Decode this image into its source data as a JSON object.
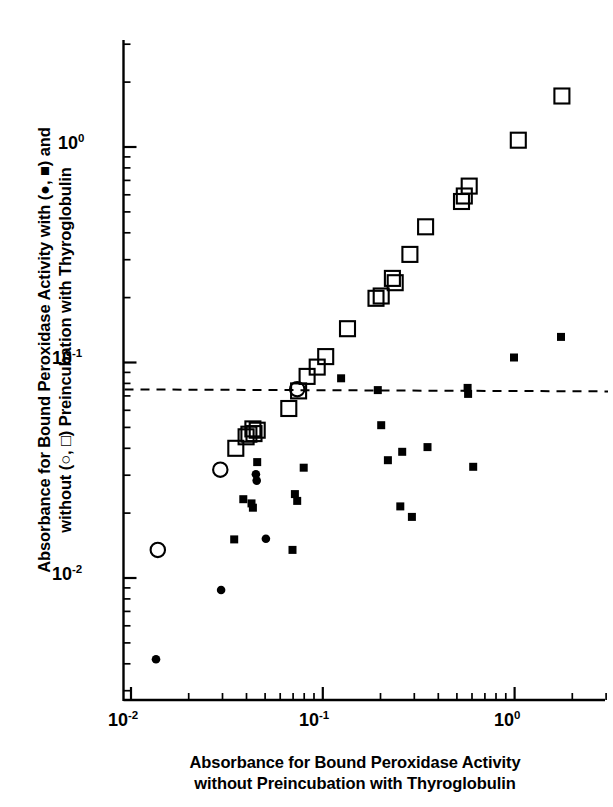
{
  "chart_data": {
    "type": "scatter",
    "title": "",
    "xlabel": "Absorbance for Bound Peroxidase Activity without Preincubation with Thyroglobulin",
    "ylabel": "Absorbance for Bound Peroxidase Activity with (●, ■) and without (○, □) Preincubation with Thyroglobulin",
    "xscale": "log",
    "yscale": "log",
    "xlim": [
      0.0092,
      2.3
    ],
    "ylim": [
      0.0031,
      2.4
    ],
    "grid": false,
    "legend_position": "in-axis-labels",
    "xticks": [
      0.01,
      0.1,
      1
    ],
    "xtick_labels": [
      "10-2",
      "10-1",
      "100"
    ],
    "yticks": [
      0.01,
      0.1,
      1
    ],
    "ytick_labels": [
      "10-2",
      "10-1",
      "100"
    ],
    "annotations": [
      {
        "type": "hline",
        "y": 0.075,
        "style": "dashed",
        "label": "cut-off threshold"
      }
    ],
    "series": [
      {
        "name": "Preincubation with Thyroglobulin (filled markers)",
        "marker": "filled-square-and-circle",
        "color": "#000000",
        "points": [
          {
            "x": 0.0135,
            "y": 0.0042,
            "marker": "circle"
          },
          {
            "x": 0.0295,
            "y": 0.0088,
            "marker": "circle"
          },
          {
            "x": 0.0345,
            "y": 0.0151,
            "marker": "square"
          },
          {
            "x": 0.0385,
            "y": 0.0232,
            "marker": "square"
          },
          {
            "x": 0.0425,
            "y": 0.0222,
            "marker": "square"
          },
          {
            "x": 0.0432,
            "y": 0.0212,
            "marker": "square"
          },
          {
            "x": 0.0448,
            "y": 0.0303,
            "marker": "circle"
          },
          {
            "x": 0.0452,
            "y": 0.0283,
            "marker": "circle"
          },
          {
            "x": 0.0455,
            "y": 0.0345,
            "marker": "square"
          },
          {
            "x": 0.0505,
            "y": 0.0152,
            "marker": "circle"
          },
          {
            "x": 0.0695,
            "y": 0.0135,
            "marker": "square"
          },
          {
            "x": 0.0715,
            "y": 0.0245,
            "marker": "square"
          },
          {
            "x": 0.0735,
            "y": 0.0228,
            "marker": "square"
          },
          {
            "x": 0.0795,
            "y": 0.0325,
            "marker": "square"
          },
          {
            "x": 0.1245,
            "y": 0.0845,
            "marker": "square"
          },
          {
            "x": 0.1935,
            "y": 0.0745,
            "marker": "square"
          },
          {
            "x": 0.2015,
            "y": 0.0512,
            "marker": "square"
          },
          {
            "x": 0.2185,
            "y": 0.0352,
            "marker": "square"
          },
          {
            "x": 0.2535,
            "y": 0.0215,
            "marker": "square"
          },
          {
            "x": 0.2595,
            "y": 0.0385,
            "marker": "square"
          },
          {
            "x": 0.2915,
            "y": 0.0192,
            "marker": "square"
          },
          {
            "x": 0.3515,
            "y": 0.0405,
            "marker": "square"
          },
          {
            "x": 0.5685,
            "y": 0.0762,
            "marker": "square"
          },
          {
            "x": 0.5725,
            "y": 0.0715,
            "marker": "square"
          },
          {
            "x": 0.6085,
            "y": 0.0328,
            "marker": "square"
          },
          {
            "x": 0.9925,
            "y": 0.1055,
            "marker": "square"
          },
          {
            "x": 1.745,
            "y": 0.1315,
            "marker": "square"
          }
        ]
      },
      {
        "name": "Without Preincubation with Thyroglobulin (open markers)",
        "marker": "open-square-and-circle",
        "color": "#000000",
        "points": [
          {
            "x": 0.0138,
            "y": 0.0135,
            "marker": "circle"
          },
          {
            "x": 0.0292,
            "y": 0.0318,
            "marker": "circle"
          },
          {
            "x": 0.0352,
            "y": 0.04,
            "marker": "square"
          },
          {
            "x": 0.0398,
            "y": 0.0452,
            "marker": "square"
          },
          {
            "x": 0.0412,
            "y": 0.0465,
            "marker": "square"
          },
          {
            "x": 0.0432,
            "y": 0.0492,
            "marker": "square"
          },
          {
            "x": 0.0438,
            "y": 0.0468,
            "marker": "square"
          },
          {
            "x": 0.0455,
            "y": 0.0485,
            "marker": "square"
          },
          {
            "x": 0.0665,
            "y": 0.0612,
            "marker": "square"
          },
          {
            "x": 0.0735,
            "y": 0.0752,
            "marker": "circle"
          },
          {
            "x": 0.0748,
            "y": 0.0738,
            "marker": "square"
          },
          {
            "x": 0.0828,
            "y": 0.0862,
            "marker": "square"
          },
          {
            "x": 0.0935,
            "y": 0.0952,
            "marker": "square"
          },
          {
            "x": 0.1035,
            "y": 0.1065,
            "marker": "square"
          },
          {
            "x": 0.1345,
            "y": 0.1435,
            "marker": "square"
          },
          {
            "x": 0.1895,
            "y": 0.1985,
            "marker": "square"
          },
          {
            "x": 0.2015,
            "y": 0.2035,
            "marker": "square"
          },
          {
            "x": 0.2305,
            "y": 0.2455,
            "marker": "square"
          },
          {
            "x": 0.2385,
            "y": 0.2345,
            "marker": "square"
          },
          {
            "x": 0.2845,
            "y": 0.3175,
            "marker": "square"
          },
          {
            "x": 0.3435,
            "y": 0.4265,
            "marker": "square"
          },
          {
            "x": 0.5285,
            "y": 0.5585,
            "marker": "square"
          },
          {
            "x": 0.5465,
            "y": 0.5925,
            "marker": "square"
          },
          {
            "x": 0.5795,
            "y": 0.6585,
            "marker": "square"
          },
          {
            "x": 1.045,
            "y": 1.075,
            "marker": "square"
          },
          {
            "x": 1.765,
            "y": 1.725,
            "marker": "square"
          }
        ]
      }
    ]
  },
  "axes": {
    "y_label_line1": "Absorbance for Bound Peroxidase Activity with (●, ■) and",
    "y_label_line2": "without (○, □) Preincubation with Thyroglobulin",
    "x_label_line1": "Absorbance for Bound Peroxidase Activity",
    "x_label_line2": "without Preincubation with Thyroglobulin",
    "y_tick_1": "10",
    "y_tick_1_exp": "0",
    "y_tick_2": "10",
    "y_tick_2_exp": "-1",
    "y_tick_3": "10",
    "y_tick_3_exp": "-2",
    "x_tick_1": "10",
    "x_tick_1_exp": "-2",
    "x_tick_2": "10",
    "x_tick_2_exp": "-1",
    "x_tick_3": "10",
    "x_tick_3_exp": "0"
  },
  "colors": {
    "ink": "#000000",
    "background": "#ffffff"
  }
}
